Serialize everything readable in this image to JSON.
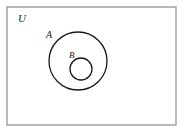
{
  "figure": {
    "type": "venn-diagram",
    "width": 184,
    "height": 133,
    "background_color": "#ffffff"
  },
  "universe": {
    "label": "U",
    "shape": "rectangle",
    "x": 7,
    "y": 7,
    "width": 169,
    "height": 118,
    "stroke_color": "#8a8a8a",
    "stroke_width": 1.2,
    "fill": "none",
    "label_x": 18,
    "label_y": 22,
    "label_font_size": 11
  },
  "sets": [
    {
      "label": "A",
      "shape": "circle",
      "cx": 78,
      "cy": 61,
      "r": 29,
      "stroke_color": "#1a1a1a",
      "stroke_width": 1.3,
      "fill": "none",
      "label_x": 46,
      "label_y": 38,
      "label_font_size": 10
    },
    {
      "label": "B",
      "shape": "circle",
      "cx": 81,
      "cy": 69,
      "r": 11,
      "stroke_color": "#1a1a1a",
      "stroke_width": 1.3,
      "fill": "none",
      "label_x": 69,
      "label_y": 58,
      "label_font_size": 9
    }
  ]
}
